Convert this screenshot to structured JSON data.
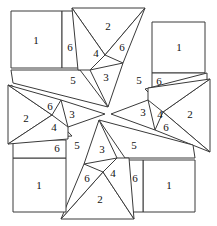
{
  "diagram": {
    "type": "quilt-block-pattern",
    "background_color": "#ffffff",
    "line_color": "#3a3a3a",
    "label_color": "#111111",
    "symmetry": "4-fold rotational",
    "piece_numbers": [
      "1",
      "2",
      "3",
      "4",
      "5",
      "6"
    ],
    "width": 217,
    "height": 226
  },
  "labels": {
    "tl_square_1": "1",
    "tl_six": "6",
    "tl_five": "5",
    "tl_two": "2",
    "tl_four": "4",
    "tl_six_b": "6",
    "tl_three": "3",
    "tr_square_1": "1",
    "tr_five": "5",
    "tr_six": "6",
    "tr_two": "2",
    "tr_four": "4",
    "tr_six_b": "6",
    "tr_three": "3",
    "br_square_1": "1",
    "br_five": "5",
    "br_six": "6",
    "br_two": "2",
    "br_four": "4",
    "br_six_b": "6",
    "br_three": "3",
    "bl_square_1": "1",
    "bl_five": "5",
    "bl_six": "6",
    "bl_two": "2",
    "bl_four": "4",
    "bl_six_b": "6",
    "bl_three": "3"
  }
}
